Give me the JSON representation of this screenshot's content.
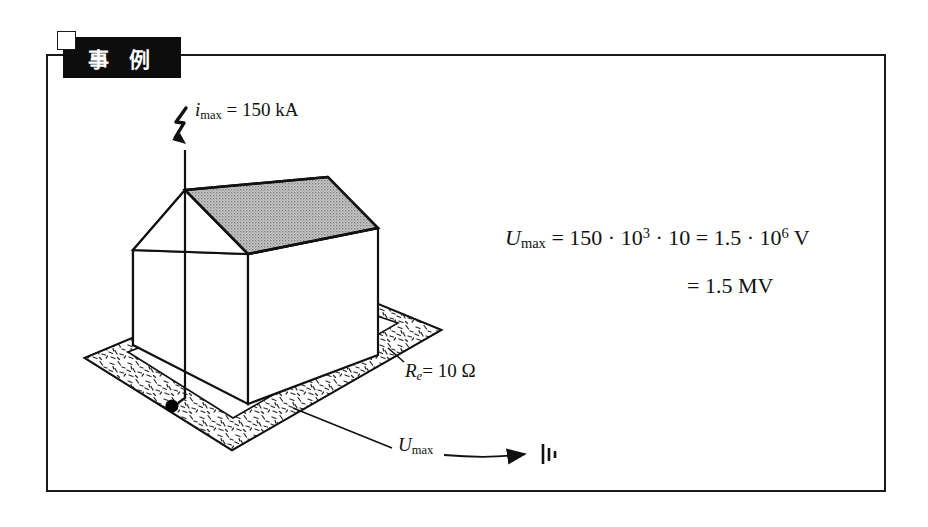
{
  "page": {
    "background_color": "#ffffff",
    "frame_color": "#1a1a1a"
  },
  "header": {
    "banner_label": "事 例",
    "banner_background": "#0d0d0d",
    "banner_text_color": "#ffffff",
    "notch_name": "corner-notch"
  },
  "diagram": {
    "house": {
      "roof_fill": "#b9b9b9",
      "wall_fill": "#ffffff",
      "outline_color": "#111111"
    },
    "ground_ring": {
      "fill": "#ffffff",
      "texture": "stipple-dashes",
      "outline_color": "#111111"
    },
    "earth_point_color": "#000000",
    "icons": {
      "lightning": "lightning-bolt-icon",
      "earth": "earth-ground-icon",
      "arrow": "arrow-right-icon"
    }
  },
  "labels": {
    "current": {
      "symbol": "i",
      "subscript": "max",
      "equals": "=",
      "value": "150 kA",
      "full": "i max = 150 kA"
    },
    "resistance": {
      "symbol": "R",
      "subscript": "e",
      "equals": "=",
      "value": "10 Ω",
      "full": "Re = 10 Ω"
    },
    "voltage_arrow": {
      "symbol": "U",
      "subscript": "max",
      "full": "U max"
    }
  },
  "equation": {
    "line1": {
      "symbol": "U",
      "subscript": "max",
      "equals_1": "=",
      "term_a": "150",
      "dot_1": "·",
      "term_b_base": "10",
      "term_b_exp": "3",
      "dot_2": "·",
      "term_c": "10",
      "equals_2": "=",
      "result_mantissa": "1.5",
      "dot_3": "·",
      "result_base": "10",
      "result_exp": "6",
      "result_unit": "V",
      "full": "U max = 150 · 10^3 · 10 = 1.5 · 10^6 V"
    },
    "line2": {
      "equals": "=",
      "value": "1.5",
      "unit": "MV",
      "full": "= 1.5 MV"
    }
  }
}
